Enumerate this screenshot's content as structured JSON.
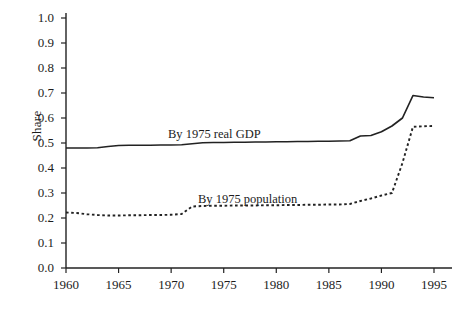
{
  "figure": {
    "background_color": "#ffffff",
    "ink_color": "#222222"
  },
  "chart_data": {
    "type": "line",
    "title": "",
    "xlabel": "",
    "ylabel": "Share",
    "xlim": [
      1960,
      1995
    ],
    "ylim": [
      0.0,
      1.0
    ],
    "grid": false,
    "legend": "inline-annotations",
    "xticks": [
      1960,
      1965,
      1970,
      1975,
      1980,
      1985,
      1990,
      1995
    ],
    "xtick_labels": [
      "1960",
      "1965",
      "1970",
      "1975",
      "1980",
      "1985",
      "1990",
      "1995"
    ],
    "yticks": [
      0.0,
      0.1,
      0.2,
      0.3,
      0.4,
      0.5,
      0.6,
      0.7,
      0.8,
      0.9,
      1.0
    ],
    "ytick_labels": [
      "0.0",
      "0.1",
      "0.2",
      "0.3",
      "0.4",
      "0.5",
      "0.6",
      "0.7",
      "0.8",
      "0.9",
      "1.0"
    ],
    "x": [
      1960,
      1961,
      1962,
      1963,
      1964,
      1965,
      1966,
      1967,
      1968,
      1969,
      1970,
      1971,
      1972,
      1973,
      1974,
      1975,
      1976,
      1977,
      1978,
      1979,
      1980,
      1981,
      1982,
      1983,
      1984,
      1985,
      1986,
      1987,
      1988,
      1989,
      1990,
      1991,
      1992,
      1993,
      1994,
      1995
    ],
    "series": [
      {
        "name": "By 1975 real GDP",
        "style": "solid",
        "annotation": "By 1975 real GDP",
        "values": [
          0.48,
          0.48,
          0.48,
          0.481,
          0.486,
          0.49,
          0.491,
          0.491,
          0.491,
          0.492,
          0.492,
          0.493,
          0.497,
          0.501,
          0.502,
          0.502,
          0.503,
          0.503,
          0.504,
          0.504,
          0.505,
          0.505,
          0.506,
          0.506,
          0.507,
          0.507,
          0.508,
          0.509,
          0.528,
          0.53,
          0.545,
          0.568,
          0.6,
          0.69,
          0.684,
          0.681
        ]
      },
      {
        "name": "By 1975 population",
        "style": "dashed",
        "annotation": "By 1975 population",
        "values": [
          0.222,
          0.22,
          0.215,
          0.212,
          0.21,
          0.21,
          0.211,
          0.211,
          0.212,
          0.212,
          0.213,
          0.216,
          0.246,
          0.248,
          0.249,
          0.249,
          0.25,
          0.25,
          0.25,
          0.251,
          0.251,
          0.252,
          0.252,
          0.253,
          0.253,
          0.254,
          0.254,
          0.256,
          0.268,
          0.278,
          0.29,
          0.3,
          0.42,
          0.565,
          0.567,
          0.568
        ]
      }
    ]
  }
}
